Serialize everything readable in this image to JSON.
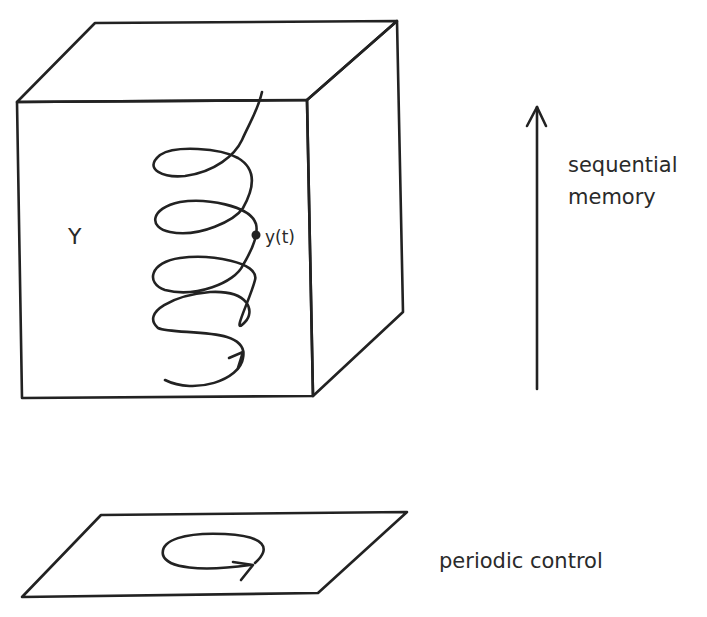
{
  "diagram": {
    "state_space": {
      "label": "Y",
      "point_label": "y(t)",
      "shape": "cube",
      "trajectory": "helix-ascending"
    },
    "axis": {
      "label_line1": "sequential",
      "label_line2": "memory",
      "direction": "up"
    },
    "control_plane": {
      "label": "periodic control",
      "trajectory": "closed-loop-ellipse"
    },
    "colors": {
      "ink": "#222222",
      "background": "#ffffff"
    }
  }
}
